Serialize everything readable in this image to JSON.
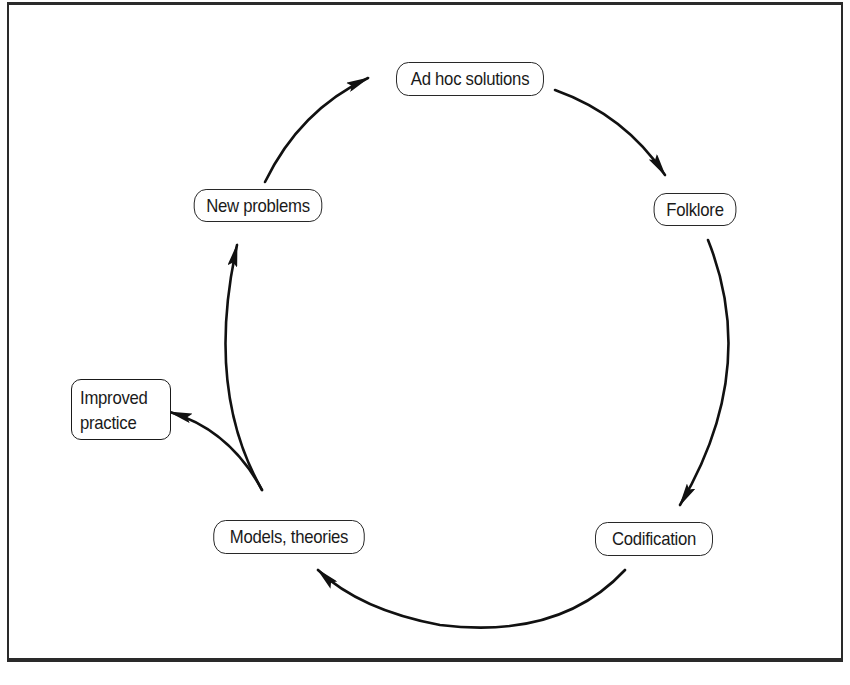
{
  "diagram": {
    "type": "cycle",
    "nodes": {
      "ad_hoc": "Ad hoc solutions",
      "folklore": "Folklore",
      "codification": "Codification",
      "models": "Models, theories",
      "new_problems": "New problems",
      "improved_practice_line1": "Improved",
      "improved_practice_line2": "practice"
    },
    "edges": [
      {
        "from": "Ad hoc solutions",
        "to": "Folklore"
      },
      {
        "from": "Folklore",
        "to": "Codification"
      },
      {
        "from": "Codification",
        "to": "Models, theories"
      },
      {
        "from": "Models, theories",
        "to": "New problems"
      },
      {
        "from": "New problems",
        "to": "Ad hoc solutions"
      },
      {
        "from": "Models, theories",
        "to": "Improved practice"
      }
    ],
    "colors": {
      "stroke": "#1a1a1a",
      "background": "#ffffff"
    }
  }
}
